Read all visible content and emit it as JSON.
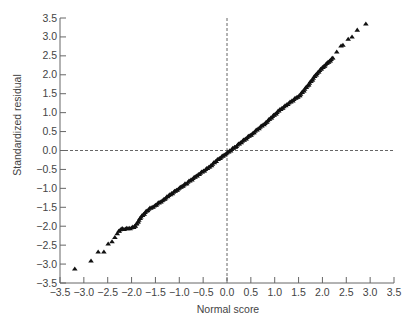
{
  "chart_data": {
    "type": "scatter",
    "title": "",
    "xlabel": "Normal score",
    "ylabel": "Standardized residual",
    "xlim": [
      -3.5,
      3.5
    ],
    "ylim": [
      -3.5,
      3.5
    ],
    "grid": false,
    "legend": "none",
    "marker": "triangle",
    "reference_lines": [
      {
        "orientation": "horizontal",
        "value": 0.0,
        "style": "dashed"
      },
      {
        "orientation": "vertical",
        "value": 0.0,
        "style": "dashed"
      }
    ],
    "x_ticks": [
      "-3.5",
      "-3.0",
      "-2.5",
      "-2.0",
      "-1.5",
      "-1.0",
      "-0.5",
      "0.0",
      "0.5",
      "1.0",
      "1.5",
      "2.0",
      "2.5",
      "3.0",
      "3.5"
    ],
    "y_ticks": [
      "3.5",
      "3.0",
      "2.5",
      "2.0",
      "1.5",
      "1.0",
      "0.5",
      "0.0",
      "-0.5",
      "-1.0",
      "-1.5",
      "-2.0",
      "-2.5",
      "-3.0",
      "-3.5"
    ],
    "x_tick_values": [
      -3.5,
      -3.0,
      -2.5,
      -2.0,
      -1.5,
      -1.0,
      -0.5,
      0.0,
      0.5,
      1.0,
      1.5,
      2.0,
      2.5,
      3.0,
      3.5
    ],
    "y_tick_values": [
      3.5,
      3.0,
      2.5,
      2.0,
      1.5,
      1.0,
      0.5,
      0.0,
      -0.5,
      -1.0,
      -1.5,
      -2.0,
      -2.5,
      -3.0,
      -3.5
    ],
    "sparse_points": [
      [
        -3.19,
        -3.13
      ],
      [
        -2.85,
        -2.92
      ],
      [
        -2.7,
        -2.68
      ],
      [
        -2.58,
        -2.68
      ],
      [
        -2.49,
        -2.47
      ],
      [
        -2.41,
        -2.41
      ],
      [
        -2.35,
        -2.3
      ],
      [
        -2.3,
        -2.2
      ],
      [
        2.3,
        2.6
      ],
      [
        2.39,
        2.76
      ],
      [
        2.43,
        2.78
      ],
      [
        2.54,
        2.94
      ],
      [
        2.62,
        3.0
      ],
      [
        2.73,
        3.18
      ],
      [
        2.91,
        3.34
      ]
    ],
    "dense_curve_anchors": [
      [
        -2.27,
        -2.15
      ],
      [
        -2.22,
        -2.08
      ],
      [
        -2.15,
        -2.07
      ],
      [
        -2.05,
        -2.06
      ],
      [
        -1.95,
        -2.03
      ],
      [
        -1.9,
        -1.96
      ],
      [
        -1.8,
        -1.76
      ],
      [
        -1.66,
        -1.57
      ],
      [
        -1.5,
        -1.45
      ],
      [
        -1.34,
        -1.31
      ],
      [
        -1.2,
        -1.18
      ],
      [
        -1.0,
        -1.0
      ],
      [
        -0.84,
        -0.86
      ],
      [
        -0.6,
        -0.64
      ],
      [
        -0.36,
        -0.43
      ],
      [
        -0.2,
        -0.25
      ],
      [
        0.0,
        -0.07
      ],
      [
        0.2,
        0.12
      ],
      [
        0.55,
        0.46
      ],
      [
        0.8,
        0.72
      ],
      [
        1.11,
        1.07
      ],
      [
        1.3,
        1.25
      ],
      [
        1.53,
        1.46
      ],
      [
        1.7,
        1.72
      ],
      [
        1.89,
        2.04
      ],
      [
        2.0,
        2.18
      ],
      [
        2.1,
        2.3
      ],
      [
        2.22,
        2.44
      ]
    ]
  }
}
